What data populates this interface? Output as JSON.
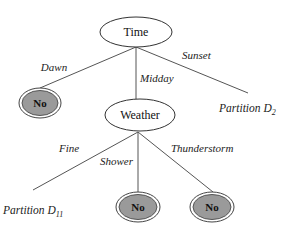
{
  "diagram": {
    "type": "decision-tree",
    "colors": {
      "leaf_fill": "#9a9a9a",
      "edge": "#555555",
      "node_fill": "#ffffff"
    },
    "root": {
      "label": "Time"
    },
    "edges_root": {
      "dawn": "Dawn",
      "midday": "Midday",
      "sunset": "Sunset"
    },
    "leaf_dawn": {
      "label": "No"
    },
    "weather": {
      "label": "Weather"
    },
    "edges_weather": {
      "fine": "Fine",
      "shower": "Shower",
      "thunderstorm": "Thunderstorm"
    },
    "leaf_shower": {
      "label": "No"
    },
    "leaf_thunderstorm": {
      "label": "No"
    },
    "partition_d2": {
      "text": "Partition D",
      "sub": "2"
    },
    "partition_d11": {
      "text": "Partition D",
      "sub": "11"
    }
  }
}
